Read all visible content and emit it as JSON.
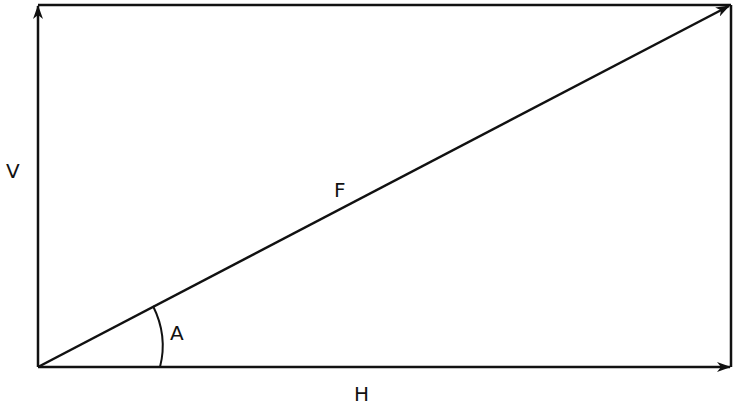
{
  "diagram": {
    "labels": {
      "vertical": "V",
      "force": "F",
      "angle": "A",
      "horizontal": "H"
    },
    "colors": {
      "line": "#111111",
      "background": "#ffffff"
    },
    "geometry": {
      "origin": [
        38,
        367
      ],
      "top_left": [
        38,
        5
      ],
      "top_right": [
        731,
        5
      ],
      "bottom_right": [
        731,
        367
      ]
    }
  }
}
